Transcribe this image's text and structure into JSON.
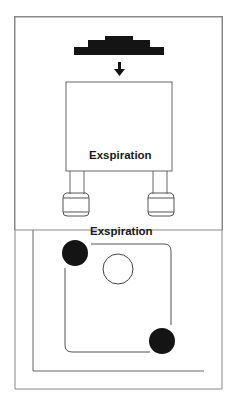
{
  "diagram": {
    "upper_panel": {
      "label": "Exspiration",
      "top_block": "stepped-weight",
      "arrow": "down-arrow"
    },
    "lower_panel": {
      "label": "Exspiration",
      "markers": [
        "filled-circle-top-left",
        "open-circle-center",
        "filled-circle-bottom-right"
      ]
    },
    "colors": {
      "ink": "#1a1a1a",
      "line": "#555555",
      "background": "#ffffff"
    }
  }
}
